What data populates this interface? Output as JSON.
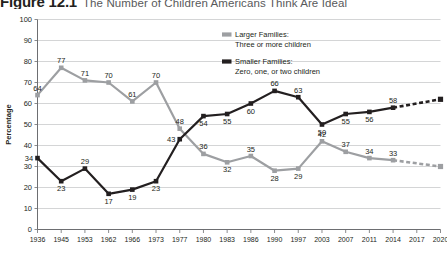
{
  "figure": {
    "number": "Figure 12.1",
    "title": "The Number of Children Americans Think Are Ideal"
  },
  "legend": {
    "position": "top-center",
    "entries": [
      {
        "swatch_color": "#9d9fa2",
        "line1": "Larger Families:",
        "line2": "Three or more children"
      },
      {
        "swatch_color": "#231f20",
        "line1": "Smaller Families:",
        "line2": "Zero, one, or two children"
      }
    ]
  },
  "chart_data": {
    "type": "line",
    "title": "The Number of Children Americans Think Are Ideal",
    "xlabel": "",
    "ylabel": "Percentage",
    "ylim": [
      0,
      100
    ],
    "ytick_step": 10,
    "yticks": [
      "0",
      "10",
      "20",
      "30",
      "40",
      "50",
      "60",
      "70",
      "80",
      "90",
      "100"
    ],
    "grid": true,
    "grid_axis": "y",
    "categories": [
      "1936",
      "1945",
      "1953",
      "1962",
      "1966",
      "1973",
      "1977",
      "1980",
      "1983",
      "1986",
      "1990",
      "1997",
      "2003",
      "2007",
      "2011",
      "2014",
      "2017",
      "2020"
    ],
    "series": [
      {
        "name": "Larger Families: Three or more children",
        "color": "#9d9fa2",
        "values": [
          64,
          77,
          71,
          70,
          61,
          70,
          48,
          36,
          32,
          35,
          28,
          29,
          42,
          37,
          34,
          33,
          null,
          30
        ],
        "labels": [
          "64",
          "77",
          "71",
          "70",
          "61",
          "70",
          "48",
          "36",
          "32",
          "35",
          "28",
          "29",
          "42",
          "37",
          "34",
          "33",
          "",
          ""
        ],
        "label_positions": [
          "above",
          "above",
          "above",
          "above",
          "above",
          "above",
          "above",
          "above",
          "below",
          "above",
          "below",
          "below",
          "above",
          "above",
          "above",
          "above",
          "",
          ""
        ],
        "dashed_from_index": 15,
        "projection_note": "2014-2020 shown as dashed projection"
      },
      {
        "name": "Smaller Families: Zero, one, or two children",
        "color": "#231f20",
        "values": [
          34,
          23,
          29,
          17,
          19,
          23,
          43,
          54,
          55,
          60,
          66,
          63,
          50,
          55,
          56,
          58,
          null,
          62
        ],
        "labels": [
          "34",
          "23",
          "29",
          "17",
          "19",
          "23",
          "43",
          "54",
          "55",
          "60",
          "66",
          "63",
          "50",
          "55",
          "56",
          "58",
          "",
          ""
        ],
        "label_positions": [
          "left",
          "below",
          "above",
          "below",
          "below",
          "below",
          "left",
          "below",
          "below",
          "below",
          "above",
          "above",
          "below",
          "below",
          "below",
          "above",
          "",
          ""
        ],
        "dashed_from_index": 15,
        "projection_note": "2014-2020 shown as dashed projection"
      }
    ]
  }
}
